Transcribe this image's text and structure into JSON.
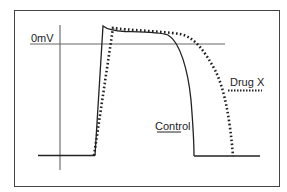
{
  "figure": {
    "title": "",
    "zero_label": "0mV",
    "legend": {
      "drug": "Drug X",
      "control": "Control"
    },
    "series": [
      {
        "name": "Control",
        "style": "solid"
      },
      {
        "name": "Drug X",
        "style": "dotted"
      }
    ],
    "colors": {
      "line": "#222222",
      "axis": "#555555",
      "border": "#444444",
      "background": "#ffffff"
    }
  }
}
